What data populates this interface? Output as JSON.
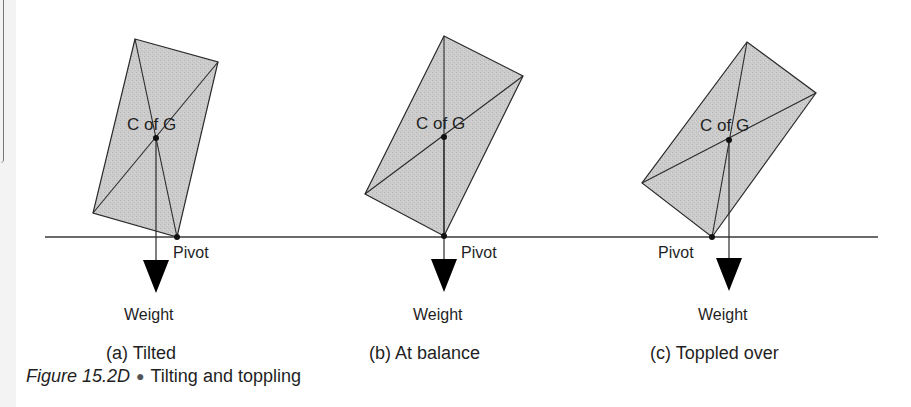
{
  "figure": {
    "number": "Figure 15.2D",
    "bullet": "●",
    "title": "Tilting and toppling"
  },
  "colors": {
    "block_fill": "#c9c9c9",
    "line": "#2a2a2a",
    "arrow": "#000000",
    "background": "#ffffff"
  },
  "panels": [
    {
      "id": "a",
      "caption": "(a) Tilted",
      "cog_label": "C of G",
      "pivot_label": "Pivot",
      "weight_label": "Weight",
      "block_vertices": [
        [
          135,
          39
        ],
        [
          218,
          62
        ],
        [
          177,
          237
        ],
        [
          93,
          213
        ]
      ],
      "cog_point": [
        156,
        138
      ],
      "pivot_point": [
        177,
        237
      ],
      "state": "weight line inside pivot - returns upright"
    },
    {
      "id": "b",
      "caption": "(b) At balance",
      "cog_label": "C of G",
      "pivot_label": "Pivot",
      "weight_label": "Weight",
      "block_vertices": [
        [
          444,
          36
        ],
        [
          523,
          76
        ],
        [
          444,
          236
        ],
        [
          365,
          194
        ]
      ],
      "cog_point": [
        444,
        137
      ],
      "pivot_point": [
        444,
        236
      ],
      "state": "weight line passes through pivot"
    },
    {
      "id": "c",
      "caption": "(c) Toppled over",
      "cog_label": "C of G",
      "pivot_label": "Pivot",
      "weight_label": "Weight",
      "block_vertices": [
        [
          747,
          42
        ],
        [
          816,
          93
        ],
        [
          712,
          237
        ],
        [
          642,
          183
        ]
      ],
      "cog_point": [
        729,
        140
      ],
      "pivot_point": [
        712,
        237
      ],
      "state": "weight line outside pivot - topples"
    }
  ],
  "ground_line": {
    "x1": 45,
    "x2": 878,
    "y": 237
  }
}
